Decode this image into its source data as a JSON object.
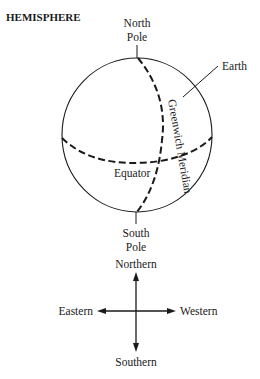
{
  "title": "HEMISPHERE",
  "globe": {
    "north_pole_line1": "North",
    "north_pole_line2": "Pole",
    "south_pole_line1": "South",
    "south_pole_line2": "Pole",
    "earth_label": "Earth",
    "equator_label": "Equator",
    "meridian_label": "Greenwich Meridian"
  },
  "compass": {
    "north": "Northern",
    "south": "Southern",
    "east": "Eastern",
    "west": "Western"
  },
  "colors": {
    "ink": "#1a1a1a",
    "background": "#ffffff"
  }
}
